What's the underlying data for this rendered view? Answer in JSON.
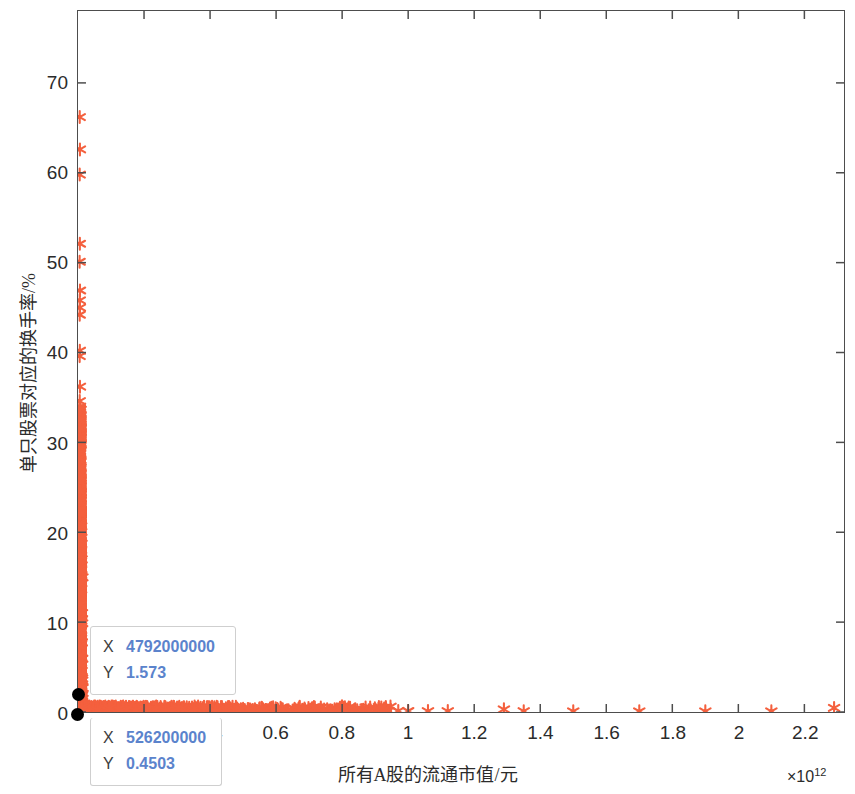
{
  "chart_data": {
    "type": "scatter",
    "title": "",
    "xlabel": "所有A股的流通市值/元",
    "ylabel": "单只股票对应的换手率/%",
    "x_exponent_prefix": "×10",
    "x_exponent_power": "12",
    "xlim": [
      0,
      2.32
    ],
    "ylim": [
      0,
      78
    ],
    "xticks": [
      0.2,
      0.4,
      0.6,
      0.8,
      1,
      1.2,
      1.4,
      1.6,
      1.8,
      2,
      2.2
    ],
    "xtick_labels": [
      "0.2",
      "0.4",
      "0.6",
      "0.8",
      "1",
      "1.2",
      "1.4",
      "1.6",
      "1.8",
      "2",
      "2.2"
    ],
    "yticks": [
      0,
      10,
      20,
      30,
      40,
      50,
      60,
      70
    ],
    "ytick_labels": [
      "0",
      "10",
      "20",
      "30",
      "40",
      "50",
      "60",
      "70"
    ],
    "grid": false,
    "legend": null,
    "marker": "asterisk",
    "marker_color": "#F4603E",
    "points": [
      [
        0.0052,
        66.2
      ],
      [
        0.0058,
        62.6
      ],
      [
        0.0051,
        59.8
      ],
      [
        0.0056,
        52.1
      ],
      [
        0.0049,
        50.1
      ],
      [
        0.006,
        46.9
      ],
      [
        0.0053,
        45.8
      ],
      [
        0.0057,
        45.0
      ],
      [
        0.0051,
        44.2
      ],
      [
        0.0055,
        40.2
      ],
      [
        0.005,
        39.6
      ],
      [
        0.0059,
        36.2
      ],
      [
        0.0052,
        34.6
      ],
      [
        0.0048,
        33.4
      ],
      [
        0.0056,
        32.4
      ],
      [
        0.0062,
        31.1
      ],
      [
        0.0051,
        30.4
      ],
      [
        0.0058,
        30.0
      ],
      [
        0.0049,
        29.6
      ],
      [
        0.0054,
        29.0
      ],
      [
        0.0061,
        28.4
      ],
      [
        0.0047,
        27.8
      ],
      [
        0.0055,
        27.1
      ],
      [
        0.0052,
        26.6
      ],
      [
        0.0066,
        26.0
      ],
      [
        0.0059,
        25.4
      ],
      [
        0.005,
        24.9
      ],
      [
        0.0071,
        24.3
      ],
      [
        0.0056,
        23.8
      ],
      [
        0.0063,
        23.3
      ],
      [
        0.0048,
        22.8
      ],
      [
        0.0058,
        22.3
      ],
      [
        0.0053,
        21.8
      ],
      [
        0.0067,
        21.3
      ],
      [
        0.0051,
        20.9
      ],
      [
        0.0061,
        20.4
      ],
      [
        0.0046,
        19.9
      ],
      [
        0.0057,
        19.5
      ],
      [
        0.0052,
        19.0
      ],
      [
        0.0064,
        18.6
      ],
      [
        0.0049,
        18.1
      ],
      [
        0.0059,
        17.7
      ],
      [
        0.0054,
        17.3
      ],
      [
        0.0069,
        16.9
      ],
      [
        0.005,
        16.5
      ],
      [
        0.0062,
        16.1
      ],
      [
        0.0047,
        15.7
      ],
      [
        0.0057,
        15.3
      ],
      [
        0.0052,
        14.9
      ],
      [
        0.0065,
        14.5
      ],
      [
        0.0048,
        14.1
      ],
      [
        0.006,
        13.7
      ],
      [
        0.0055,
        13.3
      ],
      [
        0.0072,
        13.0
      ],
      [
        0.0051,
        12.6
      ],
      [
        0.0063,
        12.2
      ],
      [
        0.0046,
        11.9
      ],
      [
        0.0058,
        11.5
      ],
      [
        0.0053,
        11.2
      ],
      [
        0.008,
        11.0
      ],
      [
        0.0049,
        10.6
      ],
      [
        0.0061,
        10.3
      ],
      [
        0.0056,
        10.0
      ],
      [
        0.009,
        9.8
      ],
      [
        0.0051,
        9.5
      ],
      [
        0.0064,
        9.2
      ],
      [
        0.0047,
        8.9
      ],
      [
        0.0059,
        8.6
      ],
      [
        0.0054,
        8.3
      ],
      [
        0.0074,
        8.1
      ],
      [
        0.005,
        7.8
      ],
      [
        0.0062,
        7.5
      ],
      [
        0.0045,
        7.3
      ],
      [
        0.0057,
        7.0
      ],
      [
        0.0052,
        6.8
      ],
      [
        0.0068,
        6.5
      ],
      [
        0.0048,
        6.3
      ],
      [
        0.006,
        6.0
      ],
      [
        0.0055,
        5.8
      ],
      [
        0.0078,
        5.6
      ],
      [
        0.0051,
        5.3
      ],
      [
        0.0063,
        5.1
      ],
      [
        0.0046,
        4.9
      ],
      [
        0.0058,
        4.7
      ],
      [
        0.0053,
        4.5
      ],
      [
        0.007,
        4.3
      ],
      [
        0.0049,
        4.1
      ],
      [
        0.0061,
        3.9
      ],
      [
        0.0056,
        3.7
      ],
      [
        0.0085,
        3.5
      ],
      [
        0.005,
        3.3
      ],
      [
        0.0064,
        3.2
      ],
      [
        0.0047,
        3.0
      ],
      [
        0.0059,
        2.8
      ],
      [
        0.0054,
        2.7
      ],
      [
        0.0075,
        2.5
      ],
      [
        0.0051,
        2.4
      ],
      [
        0.0062,
        2.2
      ],
      [
        0.0045,
        2.1
      ],
      [
        0.0057,
        1.9
      ],
      [
        0.0052,
        1.8
      ],
      [
        0.0094,
        1.73
      ],
      [
        0.0048,
        1.6
      ],
      [
        0.006,
        1.5
      ],
      [
        0.0055,
        1.4
      ],
      [
        0.0082,
        1.3
      ],
      [
        0.005,
        1.2
      ],
      [
        0.0063,
        1.1
      ],
      [
        0.0046,
        1.0
      ],
      [
        0.0058,
        0.95
      ],
      [
        0.0053,
        0.88
      ],
      [
        0.0104,
        0.82
      ],
      [
        0.012,
        0.76
      ],
      [
        0.015,
        0.71
      ],
      [
        0.018,
        0.66
      ],
      [
        0.022,
        0.62
      ],
      [
        0.027,
        0.58
      ],
      [
        0.033,
        0.55
      ],
      [
        0.04,
        0.52
      ],
      [
        0.048,
        0.5
      ],
      [
        0.056,
        0.48
      ],
      [
        0.065,
        0.46
      ],
      [
        0.075,
        0.45
      ],
      [
        0.086,
        0.43
      ],
      [
        0.097,
        0.42
      ],
      [
        0.109,
        0.41
      ],
      [
        0.121,
        0.4
      ],
      [
        0.134,
        0.39
      ],
      [
        0.147,
        0.38
      ],
      [
        0.161,
        0.37
      ],
      [
        0.176,
        0.36
      ],
      [
        0.191,
        0.36
      ],
      [
        0.206,
        0.35
      ],
      [
        0.222,
        0.34
      ],
      [
        0.238,
        0.33
      ],
      [
        0.25,
        0.33
      ],
      [
        0.262,
        0.32
      ],
      [
        0.274,
        0.31
      ],
      [
        0.286,
        0.31
      ],
      [
        0.298,
        0.3
      ],
      [
        0.31,
        0.29
      ],
      [
        0.322,
        0.29
      ],
      [
        0.334,
        0.28
      ],
      [
        0.346,
        0.28
      ],
      [
        0.358,
        0.27
      ],
      [
        0.37,
        0.27
      ],
      [
        0.382,
        0.26
      ],
      [
        0.395,
        0.26
      ],
      [
        0.41,
        0.25
      ],
      [
        0.425,
        0.24
      ],
      [
        0.44,
        0.24
      ],
      [
        0.455,
        0.23
      ],
      [
        0.47,
        0.23
      ],
      [
        0.485,
        0.22
      ],
      [
        0.5,
        0.35
      ],
      [
        0.505,
        0.22
      ],
      [
        0.52,
        0.21
      ],
      [
        0.535,
        0.2
      ],
      [
        0.55,
        0.42
      ],
      [
        0.57,
        0.19
      ],
      [
        0.59,
        0.18
      ],
      [
        0.62,
        0.3
      ],
      [
        0.65,
        0.17
      ],
      [
        0.68,
        0.16
      ],
      [
        0.71,
        0.4
      ],
      [
        0.74,
        0.15
      ],
      [
        0.77,
        0.14
      ],
      [
        0.8,
        0.6
      ],
      [
        0.82,
        0.5
      ],
      [
        0.84,
        0.3
      ],
      [
        0.86,
        0.22
      ],
      [
        0.88,
        0.18
      ],
      [
        0.91,
        0.35
      ],
      [
        0.94,
        0.14
      ],
      [
        0.97,
        0.12
      ],
      [
        1.0,
        0.11
      ],
      [
        1.06,
        0.1
      ],
      [
        1.12,
        0.1
      ],
      [
        1.29,
        0.3
      ],
      [
        1.35,
        0.09
      ],
      [
        1.5,
        0.08
      ],
      [
        1.7,
        0.08
      ],
      [
        1.9,
        0.07
      ],
      [
        2.1,
        0.07
      ],
      [
        2.29,
        0.45
      ]
    ],
    "annotations": [
      {
        "name": "data-cursor-1",
        "x_label": "X",
        "x_value": "4792000000",
        "y_label": "Y",
        "y_value": "1.573",
        "point_x": 0.004792,
        "point_y": 1.573
      },
      {
        "name": "data-cursor-2",
        "x_label": "X",
        "x_value": "526200000",
        "y_label": "Y",
        "y_value": "0.4503",
        "point_x": 0.0005262,
        "point_y": 0.4503
      }
    ]
  },
  "axes": {
    "tick_color": "#4d4d4d",
    "axis_color": "#4d4d4d",
    "background": "#ffffff"
  }
}
